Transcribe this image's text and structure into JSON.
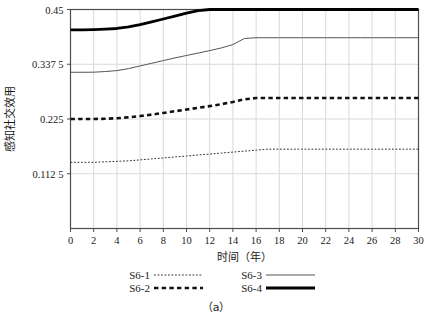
{
  "chart_data": {
    "type": "line",
    "title": "",
    "caption": "（a）",
    "xlabel": "时间（年）",
    "ylabel": "感知社交效用",
    "xlim": [
      0,
      30
    ],
    "ylim": [
      0,
      0.45
    ],
    "grid": true,
    "legend_position": "bottom",
    "xticks": [
      0,
      2,
      4,
      6,
      8,
      10,
      12,
      14,
      16,
      18,
      20,
      22,
      24,
      26,
      28,
      30
    ],
    "xtick_labels": [
      "0",
      "2",
      "4",
      "6",
      "8",
      "10",
      "12",
      "14",
      "16",
      "18",
      "20",
      "22",
      "24",
      "26",
      "28",
      "30"
    ],
    "yticks": [
      0.1125,
      0.225,
      0.3375,
      0.45
    ],
    "ytick_labels": [
      "0.112 5",
      "0.225",
      "0.337 5",
      "0.45"
    ],
    "x": [
      0,
      1,
      2,
      3,
      4,
      5,
      6,
      7,
      8,
      9,
      10,
      11,
      12,
      13,
      14,
      15,
      16,
      17,
      18,
      19,
      20,
      21,
      22,
      23,
      24,
      25,
      26,
      27,
      28,
      29,
      30
    ],
    "series": [
      {
        "name": "S6-1",
        "style": "dotted",
        "width": 1,
        "color": "#333333",
        "values": [
          0.136,
          0.136,
          0.136,
          0.137,
          0.138,
          0.139,
          0.141,
          0.143,
          0.145,
          0.147,
          0.149,
          0.151,
          0.153,
          0.155,
          0.157,
          0.159,
          0.161,
          0.163,
          0.163,
          0.163,
          0.163,
          0.163,
          0.163,
          0.163,
          0.163,
          0.163,
          0.163,
          0.163,
          0.163,
          0.163,
          0.163
        ]
      },
      {
        "name": "S6-2",
        "style": "dashed",
        "width": 2.6,
        "color": "#111111",
        "values": [
          0.225,
          0.225,
          0.225,
          0.2255,
          0.2265,
          0.2285,
          0.231,
          0.234,
          0.2375,
          0.241,
          0.2445,
          0.248,
          0.2515,
          0.2555,
          0.26,
          0.2655,
          0.268,
          0.268,
          0.268,
          0.268,
          0.268,
          0.268,
          0.268,
          0.268,
          0.268,
          0.268,
          0.268,
          0.268,
          0.268,
          0.268,
          0.268
        ]
      },
      {
        "name": "S6-3",
        "style": "solid",
        "width": 1,
        "color": "#555555",
        "values": [
          0.321,
          0.321,
          0.3212,
          0.3225,
          0.3245,
          0.3285,
          0.334,
          0.3395,
          0.345,
          0.3505,
          0.3555,
          0.3605,
          0.3655,
          0.371,
          0.378,
          0.3905,
          0.392,
          0.392,
          0.392,
          0.392,
          0.392,
          0.392,
          0.392,
          0.392,
          0.392,
          0.392,
          0.392,
          0.392,
          0.392,
          0.392,
          0.392
        ]
      },
      {
        "name": "S6-4",
        "style": "solid",
        "width": 2.8,
        "color": "#000000",
        "values": [
          0.408,
          0.408,
          0.4085,
          0.4095,
          0.411,
          0.4145,
          0.419,
          0.4245,
          0.4305,
          0.4365,
          0.4425,
          0.4475,
          0.45,
          0.45,
          0.45,
          0.45,
          0.45,
          0.45,
          0.45,
          0.45,
          0.45,
          0.45,
          0.45,
          0.45,
          0.45,
          0.45,
          0.45,
          0.45,
          0.45,
          0.45,
          0.45
        ]
      }
    ],
    "legend": [
      {
        "label": "S6-1",
        "style": "dotted",
        "width": 1,
        "color": "#333333"
      },
      {
        "label": "S6-3",
        "style": "solid",
        "width": 1,
        "color": "#555555"
      },
      {
        "label": "S6-2",
        "style": "dashed",
        "width": 2.6,
        "color": "#111111"
      },
      {
        "label": "S6-4",
        "style": "solid",
        "width": 2.8,
        "color": "#000000"
      }
    ],
    "colors": {
      "grid": "#d9d9d9",
      "axis": "#4d4d4d",
      "text": "#1a1a1a",
      "background": "#ffffff"
    }
  }
}
